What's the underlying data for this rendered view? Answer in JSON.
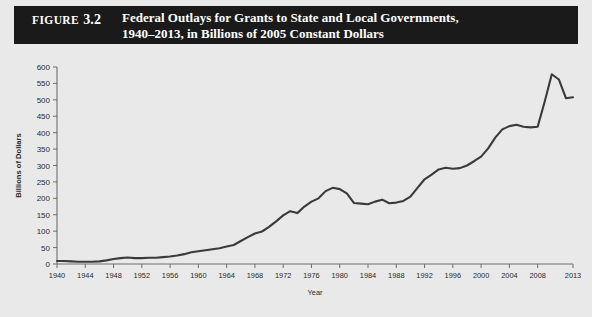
{
  "figure": {
    "label_word": "Figure",
    "number": "3.2",
    "title_line_1": "Federal Outlays for Grants to State and Local Governments,",
    "title_line_2": "1940–2013, in Billions of 2005 Constant Dollars"
  },
  "colors": {
    "header_background": "#1a1a1a",
    "header_text": "#ffffff",
    "page_background": "#e9e9e9",
    "line": "#3a3a3a",
    "axis": "#6e6e6e",
    "tick_text": "#2b2b2b"
  },
  "source_note": "",
  "chart_data": {
    "type": "line",
    "title": "Federal Outlays for Grants to State and Local Governments, 1940–2013, in Billions of 2005 Constant Dollars",
    "xlabel": "Year",
    "ylabel": "Billions of Dollars",
    "xlim": [
      1940,
      2013
    ],
    "ylim": [
      0,
      600
    ],
    "ytick_values": [
      0,
      50,
      100,
      150,
      200,
      250,
      300,
      350,
      400,
      450,
      500,
      550,
      600
    ],
    "ytick_labels": [
      "0",
      "50",
      "100",
      "150",
      "200",
      "250",
      "300",
      "350",
      "400",
      "450",
      "500",
      "550",
      "600"
    ],
    "xtick_values": [
      1940,
      1944,
      1948,
      1952,
      1956,
      1960,
      1964,
      1968,
      1972,
      1976,
      1980,
      1984,
      1988,
      1992,
      1996,
      2000,
      2004,
      2008,
      2013
    ],
    "xtick_labels": [
      "1940",
      "1944",
      "1948",
      "1952",
      "1956",
      "1960",
      "1964",
      "1968",
      "1972",
      "1976",
      "1980",
      "1984",
      "1988",
      "1992",
      "1996",
      "2000",
      "2004",
      "2008",
      "2013"
    ],
    "grid": false,
    "legend": false,
    "series": [
      {
        "name": "Federal outlays for grants to state and local governments",
        "x": [
          1940,
          1941,
          1942,
          1943,
          1944,
          1945,
          1946,
          1947,
          1948,
          1949,
          1950,
          1951,
          1952,
          1953,
          1954,
          1955,
          1956,
          1957,
          1958,
          1959,
          1960,
          1961,
          1962,
          1963,
          1964,
          1965,
          1966,
          1967,
          1968,
          1969,
          1970,
          1971,
          1972,
          1973,
          1974,
          1975,
          1976,
          1977,
          1978,
          1979,
          1980,
          1981,
          1982,
          1983,
          1984,
          1985,
          1986,
          1987,
          1988,
          1989,
          1990,
          1991,
          1992,
          1993,
          1994,
          1995,
          1996,
          1997,
          1998,
          1999,
          2000,
          2001,
          2002,
          2003,
          2004,
          2005,
          2006,
          2007,
          2008,
          2009,
          2010,
          2011,
          2012,
          2013
        ],
        "values": [
          9,
          9,
          8,
          7,
          7,
          7,
          8,
          11,
          15,
          18,
          20,
          18,
          18,
          19,
          19,
          21,
          23,
          26,
          30,
          36,
          39,
          42,
          45,
          48,
          53,
          58,
          70,
          82,
          93,
          99,
          113,
          130,
          148,
          161,
          155,
          175,
          190,
          200,
          222,
          232,
          228,
          215,
          186,
          184,
          182,
          190,
          196,
          185,
          187,
          192,
          205,
          232,
          258,
          272,
          288,
          293,
          290,
          292,
          300,
          313,
          327,
          352,
          385,
          410,
          420,
          424,
          418,
          416,
          418,
          495,
          578,
          562,
          505,
          508
        ]
      }
    ],
    "annotations": []
  }
}
